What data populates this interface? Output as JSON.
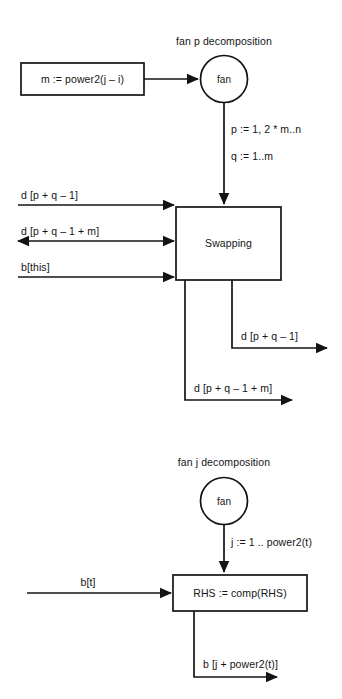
{
  "figure": {
    "kind": "dataflow-decomposition-diagram",
    "width": 342,
    "height": 699,
    "background_color": "#ffffff",
    "stroke_color": "#141414",
    "text_color": "#141414"
  },
  "diagrams": [
    {
      "id": "fan-p",
      "title": "fan p decomposition",
      "nodes": [
        {
          "id": "power2-box",
          "shape": "rect",
          "label": "m := power2(j – i)"
        },
        {
          "id": "fan-circle-p",
          "shape": "circle",
          "label": "fan"
        },
        {
          "id": "swapping-box",
          "shape": "rect",
          "label": "Swapping"
        }
      ],
      "edges": [
        {
          "id": "fan-to-swapping",
          "label_line1": "p := 1, 2 * m..n",
          "label_line2": "q := 1..m"
        },
        {
          "id": "input-d-pq1",
          "label": "d [p + q – 1]"
        },
        {
          "id": "input-d-pq1m",
          "label": "d [p + q – 1 + m]"
        },
        {
          "id": "input-bthis",
          "label": "b[this]"
        },
        {
          "id": "output-d-pq1",
          "label": "d [p + q – 1]"
        },
        {
          "id": "output-d-pq1m",
          "label": "d [p + q – 1 + m]"
        }
      ]
    },
    {
      "id": "fan-j",
      "title": "fan j decomposition",
      "nodes": [
        {
          "id": "fan-circle-j",
          "shape": "circle",
          "label": "fan"
        },
        {
          "id": "rhs-box",
          "shape": "rect",
          "label": "RHS := comp(RHS)"
        }
      ],
      "edges": [
        {
          "id": "fan-to-rhs",
          "label": "j := 1 .. power2(t)"
        },
        {
          "id": "input-bt",
          "label": "b[t]"
        },
        {
          "id": "output-b-jpower2t",
          "label": "b [j + power2(t)]"
        }
      ]
    }
  ],
  "labels": {
    "title_fan_p": "fan p decomposition",
    "title_fan_j": "fan j decomposition",
    "power2_box": "m := power2(j – i)",
    "fan_circle_p": "fan",
    "fan_circle_j": "fan",
    "swapping_box": "Swapping",
    "rhs_box": "RHS := comp(RHS)",
    "p_range": "p := 1, 2 * m..n",
    "q_range": "q := 1..m",
    "j_range": "j := 1 .. power2(t)",
    "in_d_pq1": "d [p + q – 1]",
    "in_d_pq1m": "d [p + q – 1 + m]",
    "in_bthis": "b[this]",
    "out_d_pq1": "d [p + q – 1]",
    "out_d_pq1m": "d [p + q – 1 + m]",
    "in_bt": "b[t]",
    "out_b_jpower2t": "b [j + power2(t)]"
  }
}
